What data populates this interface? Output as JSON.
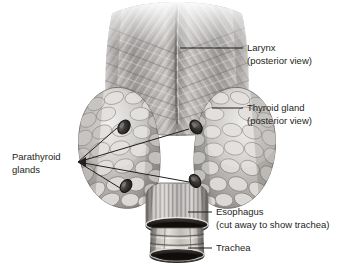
{
  "figure": {
    "background_color": "#ffffff",
    "ink_color": "#231f20",
    "width": 354,
    "height": 272
  },
  "labels": {
    "larynx": {
      "line1": "Larynx",
      "line2": "(posterior view)",
      "text_x": 247,
      "line1_y": 48,
      "line2_y": 61,
      "leader": {
        "x1": 180,
        "y1": 48,
        "x2": 243,
        "y2": 48
      }
    },
    "thyroid": {
      "line1": "Thyroid gland",
      "line2": "(posterior view)",
      "text_x": 247,
      "line1_y": 108,
      "line2_y": 121,
      "leader": {
        "x1": 212,
        "y1": 108,
        "x2": 243,
        "y2": 108
      }
    },
    "parathyroid": {
      "line1": "Parathyroid",
      "line2": "glands",
      "text_x": 12,
      "line1_y": 157,
      "line2_y": 170,
      "converge_x": 78,
      "converge_y": 162,
      "targets": [
        {
          "name": "upper-left-parathyroid",
          "x": 122,
          "y": 126
        },
        {
          "name": "upper-right-parathyroid",
          "x": 192,
          "y": 128
        },
        {
          "name": "lower-left-parathyroid",
          "x": 124,
          "y": 186
        },
        {
          "name": "lower-right-parathyroid",
          "x": 192,
          "y": 181
        }
      ]
    },
    "esophagus": {
      "line1": "Esophagus",
      "line2": "(cut away to show trachea)",
      "text_x": 216,
      "line1_y": 212,
      "line2_y": 225,
      "leader": {
        "x1": 188,
        "y1": 212,
        "x2": 212,
        "y2": 212
      }
    },
    "trachea": {
      "line1": "Trachea",
      "line2": "",
      "text_x": 216,
      "line1_y": 248,
      "leader": {
        "x1": 188,
        "y1": 248,
        "x2": 212,
        "y2": 248
      }
    }
  },
  "anatomy": {
    "larynx": {
      "name": "larynx",
      "description": "posterior laryngeal muscles with diagonal striations",
      "fill_light": "#d6d4d2",
      "fill_mid": "#a9a6a4",
      "fill_dark": "#6e6b69"
    },
    "thyroid_left_lobe": {
      "name": "thyroid-left-lobe",
      "description": "lobular cobblestone glandular tissue",
      "fill_light": "#e2e0de",
      "fill_mid": "#b3b0ae",
      "fill_dark": "#7d7a78"
    },
    "thyroid_right_lobe": {
      "name": "thyroid-right-lobe",
      "description": "lobular cobblestone glandular tissue",
      "fill_light": "#e2e0de",
      "fill_mid": "#b3b0ae",
      "fill_dark": "#7d7a78"
    },
    "parathyroid_glands": {
      "name": "parathyroid-glands",
      "count": 4,
      "fill_dark": "#2f2d2c",
      "fill_rim": "#8c8987"
    },
    "esophagus": {
      "name": "esophagus",
      "description": "cut away longitudinal muscle tube with dark elliptical cut rim",
      "fill_light": "#cfcdcb",
      "fill_mid": "#9a9795",
      "fill_dark": "#4a4846"
    },
    "trachea": {
      "name": "trachea",
      "description": "cartilage rings visible through cut esophagus",
      "fill_light": "#ddd9d4",
      "fill_mid": "#b0aca7",
      "fill_dark": "#56534f"
    }
  }
}
